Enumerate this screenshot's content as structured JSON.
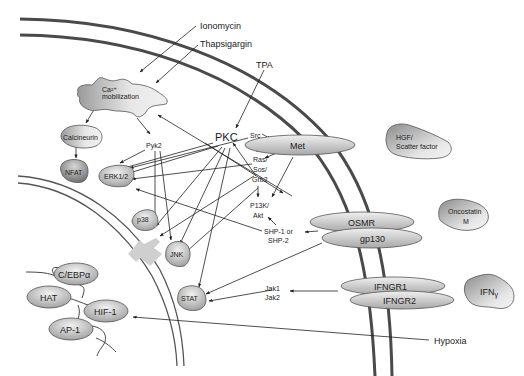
{
  "diagram": {
    "stimuli": {
      "ionomycin": "Ionomycin",
      "thapsigargin": "Thapsigargin",
      "tpa": "TPA",
      "hypoxia": "Hypoxia"
    },
    "cytoplasm": {
      "ca_line1": "Ca²⁺",
      "ca_line2": "mobilization",
      "calcineurin": "Calcineurin",
      "nfat": "NFAT",
      "pyk2": "Pyk2",
      "pkc": "PKC",
      "src": "Src",
      "ras_line1": "Ras/",
      "ras_line2": "Sos/",
      "ras_line3": "Grb2",
      "pi3k_line1": "P13K/",
      "pi3k_line2": "Akt",
      "erk": "ERK1/2",
      "p38": "p38",
      "jnk": "JNK",
      "stat": "STAT",
      "shp_line1": "SHP-1 or",
      "shp_line2": "SHP-2",
      "jak_line1": "Jak1",
      "jak_line2": "Jak2"
    },
    "receptors": {
      "met": "Met",
      "osmr": "OSMR",
      "gp130": "gp130",
      "ifngr1": "IFNGR1",
      "ifngr2": "IFNGR2"
    },
    "ligands": {
      "hgf_line1": "HGF/",
      "hgf_line2": "Scatter factor",
      "osm_line1": "Oncostatin",
      "osm_line2": "M",
      "ifn": "IFN",
      "ifn_sub": "γ"
    },
    "nucleus": {
      "cebpa": "C/EBPα",
      "hat": "HAT",
      "hif1": "HIF-1",
      "ap1": "AP-1"
    },
    "colors": {
      "membrane": "#4a4a4a",
      "node_light": "#e4e4e4",
      "node_dark": "#8a8a8a",
      "import_arrow": "#cfcfcf"
    }
  }
}
